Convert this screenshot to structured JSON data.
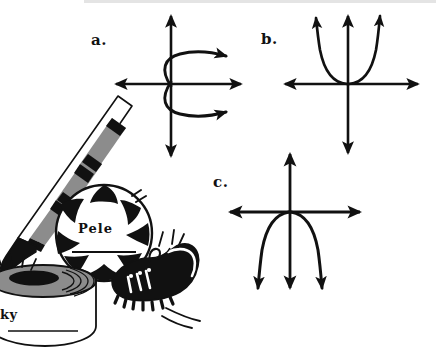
{
  "page": {
    "width": 436,
    "height": 363,
    "background_color": "#ffffff",
    "ink_color": "#111111",
    "midtone_color": "#8c8c8c"
  },
  "graphs": [
    {
      "label": "a.",
      "curve": "sideways-parabola-opening-right",
      "description": "Horizontal parabola with vertex at the origin, both branches opening to the right with arrowheads",
      "origin": {
        "x": 171,
        "y": 84
      },
      "x_axis": {
        "from_x": 114,
        "to_x": 243,
        "y": 84
      },
      "y_axis": {
        "x": 171,
        "from_y": 14,
        "to_y": 158
      }
    },
    {
      "label": "b.",
      "curve": "parabola-opening-up",
      "description": "Vertical parabola with vertex at the origin, both branches opening upward with arrowheads",
      "origin": {
        "x": 348,
        "y": 84
      },
      "x_axis": {
        "from_x": 283,
        "to_x": 420,
        "y": 84
      },
      "y_axis": {
        "x": 348,
        "from_y": 14,
        "to_y": 155
      }
    },
    {
      "label": "c.",
      "curve": "parabola-opening-down",
      "description": "Vertical parabola with vertex at the origin, both branches opening downward with arrowheads",
      "origin": {
        "x": 290,
        "y": 212
      },
      "x_axis": {
        "from_x": 228,
        "to_x": 362,
        "y": 212
      },
      "y_axis": {
        "x": 290,
        "from_y": 152,
        "to_y": 290
      }
    }
  ],
  "illustration": {
    "name": "sports-equipment-clipart",
    "items": [
      {
        "name": "hockey-stick",
        "label": ""
      },
      {
        "name": "soccer-ball",
        "label": "Pele"
      },
      {
        "name": "soccer-cleat",
        "label": ""
      },
      {
        "name": "hockey-puck",
        "label": "ky"
      }
    ]
  }
}
